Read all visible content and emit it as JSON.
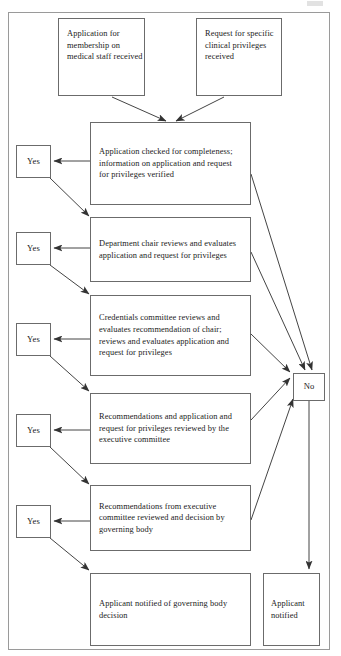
{
  "diagram": {
    "type": "flowchart",
    "frame_label": "diagram-border",
    "nodes": [
      {
        "id": "start-application",
        "kind": "start",
        "text": "Application for membership on medical staff received"
      },
      {
        "id": "start-request",
        "kind": "start",
        "text": "Request for specific clinical privileges received"
      },
      {
        "id": "step-completeness",
        "kind": "process",
        "text": "Application checked for completeness; information on application and request for privileges verified"
      },
      {
        "id": "step-department-chair",
        "kind": "process",
        "text": "Department chair reviews and evaluates application and request for privileges"
      },
      {
        "id": "step-credentials-committee",
        "kind": "process",
        "text": "Credentials committee reviews and evaluates recommendation of chair; reviews and evaluates application and request for privileges"
      },
      {
        "id": "step-executive-committee",
        "kind": "process",
        "text": "Recommendations and application and request for privileges reviewed by the executive committee"
      },
      {
        "id": "step-governing-body",
        "kind": "process",
        "text": "Recommendations from executive committee reviewed and decision by governing body"
      },
      {
        "id": "end-notified-governing",
        "kind": "terminal",
        "text": "Applicant notified of governing body decision"
      },
      {
        "id": "end-notified",
        "kind": "terminal",
        "text": "Applicant notified"
      }
    ],
    "decisions": {
      "yes_label": "Yes",
      "no_label": "No",
      "yes_count": 5,
      "no_count": 1
    },
    "edges": [
      {
        "from": "start-application",
        "to": "step-completeness",
        "label": ""
      },
      {
        "from": "start-request",
        "to": "step-completeness",
        "label": ""
      },
      {
        "from": "step-completeness",
        "to": "yes-1",
        "label": "Yes"
      },
      {
        "from": "yes-1",
        "to": "step-department-chair",
        "label": ""
      },
      {
        "from": "step-department-chair",
        "to": "yes-2",
        "label": "Yes"
      },
      {
        "from": "yes-2",
        "to": "step-credentials-committee",
        "label": ""
      },
      {
        "from": "step-credentials-committee",
        "to": "yes-3",
        "label": "Yes"
      },
      {
        "from": "yes-3",
        "to": "step-executive-committee",
        "label": ""
      },
      {
        "from": "step-executive-committee",
        "to": "yes-4",
        "label": "Yes"
      },
      {
        "from": "yes-4",
        "to": "step-governing-body",
        "label": ""
      },
      {
        "from": "step-governing-body",
        "to": "yes-5",
        "label": "Yes"
      },
      {
        "from": "yes-5",
        "to": "end-notified-governing",
        "label": ""
      },
      {
        "from": "step-completeness",
        "to": "no",
        "label": "No"
      },
      {
        "from": "step-department-chair",
        "to": "no",
        "label": "No"
      },
      {
        "from": "step-credentials-committee",
        "to": "no",
        "label": "No"
      },
      {
        "from": "step-executive-committee",
        "to": "no",
        "label": "No"
      },
      {
        "from": "step-governing-body",
        "to": "no",
        "label": "No"
      },
      {
        "from": "no",
        "to": "end-notified",
        "label": ""
      }
    ]
  },
  "colors": {
    "node_border": "#6b6b6b",
    "frame_border": "#9a9a9a",
    "line": "#444444",
    "text": "#1a1a1a",
    "background": "#ffffff"
  }
}
